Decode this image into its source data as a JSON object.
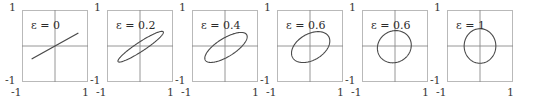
{
  "figure": {
    "panel_count": 6,
    "axis_ticks": {
      "y_max": "1",
      "y_min": "-1",
      "x_min": "-1",
      "x_max": "1"
    },
    "colors": {
      "curve": "#4a4a4a",
      "frame": "#b9b9b9",
      "axis": "#8a8a8a",
      "text": "#2b2b2b"
    }
  },
  "chart_data": {
    "type": "line",
    "title": "",
    "xlabel": "",
    "ylabel": "",
    "xlim": [
      -1,
      1
    ],
    "ylim": [
      -1,
      1
    ],
    "grid": false,
    "legend": "none",
    "panels": [
      {
        "label": "ε = 0",
        "epsilon": 0,
        "shape": "line",
        "semi_major": 0.78,
        "semi_minor": 0.0,
        "angle_deg": 27,
        "center": [
          0,
          0
        ]
      },
      {
        "label": "ε = 0.2",
        "epsilon": 0.2,
        "shape": "ellipse",
        "semi_major": 0.8,
        "semi_minor": 0.13,
        "angle_deg": 31,
        "center": [
          0.02,
          -0.02
        ]
      },
      {
        "label": "ε = 0.4",
        "epsilon": 0.4,
        "shape": "ellipse",
        "semi_major": 0.72,
        "semi_minor": 0.26,
        "angle_deg": 29,
        "center": [
          0.03,
          -0.04
        ]
      },
      {
        "label": "ε = 0.6",
        "epsilon": 0.6,
        "shape": "ellipse",
        "semi_major": 0.62,
        "semi_minor": 0.37,
        "angle_deg": 26,
        "center": [
          0.02,
          -0.03
        ]
      },
      {
        "label": "ε = 0.6",
        "epsilon": 0.6,
        "shape": "ellipse",
        "semi_major": 0.52,
        "semi_minor": 0.44,
        "angle_deg": 17,
        "center": [
          -0.02,
          -0.02
        ]
      },
      {
        "label": "ε = 1",
        "epsilon": 1,
        "shape": "circle",
        "semi_major": 0.48,
        "semi_minor": 0.48,
        "angle_deg": 0,
        "center": [
          0,
          0
        ]
      }
    ]
  }
}
